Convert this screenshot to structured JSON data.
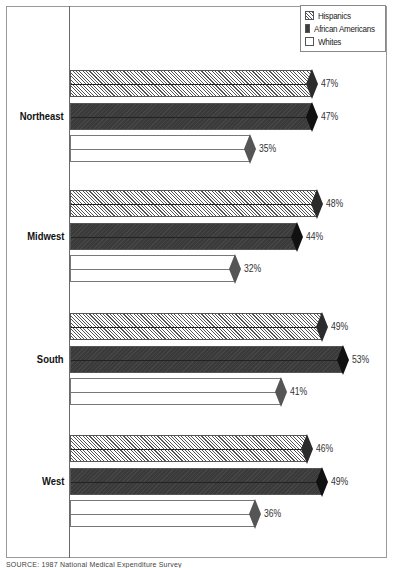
{
  "chart_data": {
    "type": "bar",
    "orientation": "horizontal",
    "title": "",
    "xlabel": "",
    "ylabel": "",
    "categories": [
      "Northeast",
      "Midwest",
      "South",
      "West"
    ],
    "series": [
      {
        "name": "Hispanics",
        "pattern": "diagonal-hatch",
        "values": [
          47,
          48,
          49,
          46
        ]
      },
      {
        "name": "African Americans",
        "pattern": "dark-solid",
        "color": "#3a3a3a",
        "values": [
          47,
          44,
          53,
          49
        ]
      },
      {
        "name": "Whites",
        "pattern": "white",
        "color": "#ffffff",
        "values": [
          35,
          32,
          41,
          36
        ]
      }
    ],
    "value_labels": [
      [
        "47%",
        "47%",
        "35%"
      ],
      [
        "48%",
        "44%",
        "32%"
      ],
      [
        "49%",
        "53%",
        "41%"
      ],
      [
        "46%",
        "49%",
        "36%"
      ]
    ],
    "legend_position": "top-right",
    "grid": false,
    "xlim": [
      0,
      60
    ],
    "unit": "%"
  },
  "legend": {
    "items": [
      "Hispanics",
      "African Americans",
      "Whites"
    ]
  },
  "regions": [
    {
      "label": "Northeast",
      "values": [
        "47%",
        "47%",
        "35%"
      ]
    },
    {
      "label": "Midwest",
      "values": [
        "48%",
        "44%",
        "32%"
      ]
    },
    {
      "label": "South",
      "values": [
        "49%",
        "53%",
        "41%"
      ]
    },
    {
      "label": "West",
      "values": [
        "46%",
        "49%",
        "36%"
      ]
    }
  ],
  "source": "SOURCE: 1987 National Medical Expenditure Survey"
}
